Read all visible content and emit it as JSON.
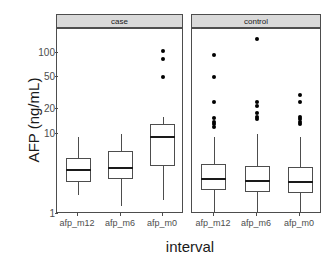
{
  "chart_data": {
    "type": "box",
    "title": "",
    "xlabel": "interval",
    "ylabel": "AFP (ng/mL)",
    "y_scale": "log10",
    "ylim": [
      1,
      200
    ],
    "y_ticks": [
      1,
      10,
      20,
      50,
      100
    ],
    "y_tick_labels": [
      "1",
      "10",
      "20",
      "50",
      "100"
    ],
    "grid": false,
    "legend": "none",
    "facet_variable": "group",
    "facets": [
      {
        "label": "case",
        "categories": [
          "afp_m12",
          "afp_m6",
          "afp_m0"
        ],
        "boxes": [
          {
            "category": "afp_m12",
            "whisker_low": 1.7,
            "q1": 2.5,
            "median": 3.5,
            "q3": 5.0,
            "whisker_high": 9.0,
            "outliers": []
          },
          {
            "category": "afp_m6",
            "whisker_low": 1.25,
            "q1": 2.7,
            "median": 3.7,
            "q3": 6.0,
            "whisker_high": 10.0,
            "outliers": []
          },
          {
            "category": "afp_m0",
            "whisker_low": 1.5,
            "q1": 4.0,
            "median": 9.0,
            "q3": 13.0,
            "whisker_high": 16.0,
            "outliers": [
              50,
              85,
              105
            ]
          }
        ]
      },
      {
        "label": "control",
        "categories": [
          "afp_m12",
          "afp_m6",
          "afp_m0"
        ],
        "boxes": [
          {
            "category": "afp_m12",
            "whisker_low": 1.0,
            "q1": 2.0,
            "median": 2.7,
            "q3": 4.2,
            "whisker_high": 9.0,
            "outliers": [
              12,
              13,
              14,
              15.5,
              25,
              50,
              95
            ]
          },
          {
            "category": "afp_m6",
            "whisker_low": 1.05,
            "q1": 1.9,
            "median": 2.6,
            "q3": 4.0,
            "whisker_high": 10.0,
            "outliers": [
              15,
              16,
              18,
              22,
              25,
              150
            ]
          },
          {
            "category": "afp_m0",
            "whisker_low": 1.0,
            "q1": 1.8,
            "median": 2.5,
            "q3": 3.8,
            "whisker_high": 9.0,
            "outliers": [
              13,
              14,
              15,
              16,
              25,
              30
            ]
          }
        ]
      }
    ]
  },
  "axes": {
    "y_title": "AFP (ng/mL)",
    "x_title": "interval",
    "y_tick_labels": [
      "100",
      "50",
      "20",
      "10",
      "1"
    ],
    "x_tick_labels": [
      "afp_m12",
      "afp_m6",
      "afp_m0"
    ]
  },
  "strips": {
    "left": "case",
    "right": "control"
  },
  "colors": {
    "panel_background": "#ffffff",
    "strip_background": "#d9d9d9",
    "box_stroke": "#4d4d4d",
    "median_stroke": "#1a1a1a",
    "outlier_fill": "#000000",
    "text": "#1a1a1a",
    "tick_text": "#4d4d4d"
  }
}
